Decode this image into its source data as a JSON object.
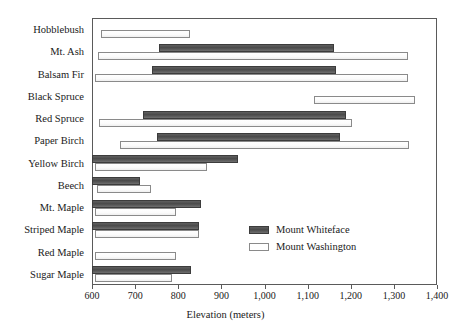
{
  "chart_data": {
    "type": "bar",
    "orientation": "horizontal",
    "title": "",
    "xlabel": "Elevation (meters)",
    "ylabel": "",
    "xlim": [
      600,
      1400
    ],
    "xticks": [
      600,
      700,
      800,
      900,
      1000,
      1100,
      1200,
      1300,
      1400
    ],
    "xticklabels": [
      "600",
      "700",
      "800",
      "900",
      "1,000",
      "1,100",
      "1,200",
      "1,300",
      "1,400"
    ],
    "grid": false,
    "legend_position": "center-right",
    "categories": [
      "Hobblebush",
      "Mt. Ash",
      "Balsam Fir",
      "Black Spruce",
      "Red Spruce",
      "Paper Birch",
      "Yellow Birch",
      "Beech",
      "Mt. Maple",
      "Striped Maple",
      "Red Maple",
      "Sugar Maple"
    ],
    "series": [
      {
        "name": "Mount Whiteface",
        "color": "#4a4a4a",
        "ranges": [
          null,
          [
            755,
            1160
          ],
          [
            740,
            1165
          ],
          null,
          [
            718,
            1188
          ],
          [
            750,
            1175
          ],
          [
            600,
            938
          ],
          [
            600,
            712
          ],
          [
            600,
            853
          ],
          [
            600,
            848
          ],
          null,
          [
            600,
            830
          ]
        ]
      },
      {
        "name": "Mount Washington",
        "color": "#ffffff",
        "ranges": [
          [
            620,
            827
          ],
          [
            613,
            1333
          ],
          [
            607,
            1333
          ],
          [
            1115,
            1350
          ],
          [
            616,
            1203
          ],
          [
            665,
            1335
          ],
          [
            607,
            867
          ],
          [
            612,
            737
          ],
          [
            607,
            795
          ],
          [
            607,
            847
          ],
          [
            607,
            795
          ],
          [
            607,
            785
          ]
        ]
      }
    ]
  },
  "legend": {
    "entries": [
      {
        "label": "Mount Whiteface",
        "swatch": "dark"
      },
      {
        "label": "Mount Washington",
        "swatch": "light"
      }
    ]
  }
}
